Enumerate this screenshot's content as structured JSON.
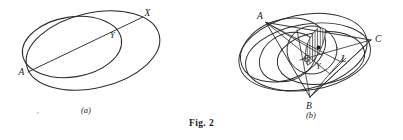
{
  "figure": {
    "caption": "Fig. 2",
    "background_color": "#ffffff",
    "ink_color": "#2b2b2b",
    "panels": [
      {
        "id": "a",
        "sub_caption": "(a)",
        "description": "Two overlapping ellipses with a chord drawn from A through Y to X",
        "point_labels": [
          {
            "name": "X",
            "text": "X"
          },
          {
            "name": "Y",
            "text": "Y"
          },
          {
            "name": "A",
            "text": "A"
          }
        ]
      },
      {
        "id": "b",
        "sub_caption": "(b)",
        "description": "Four overlapping ellipses with inscribed triangle ABC, chords, a hatched lens region, and points G, Y, L",
        "point_labels": [
          {
            "name": "A",
            "text": "A"
          },
          {
            "name": "C",
            "text": "C"
          },
          {
            "name": "B",
            "text": "B"
          },
          {
            "name": "G",
            "text": "G"
          },
          {
            "name": "Y",
            "text": "Y"
          },
          {
            "name": "L",
            "text": "L"
          }
        ],
        "hatching": {
          "style": "vertical-lines",
          "color": "#2b2b2b"
        }
      }
    ]
  }
}
